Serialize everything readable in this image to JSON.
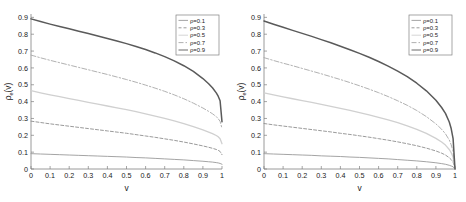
{
  "figure": {
    "panel_count": 2,
    "background": "#ffffff"
  },
  "chart_data": [
    {
      "type": "line",
      "panel": "left",
      "title": "",
      "xlabel": "v",
      "ylabel": "ρ_e(v)",
      "xlim": [
        0,
        1
      ],
      "ylim": [
        0,
        0.92
      ],
      "grid": false,
      "legend_position": "top-right",
      "xticks": [
        0,
        0.1,
        0.2,
        0.3,
        0.4,
        0.5,
        0.6,
        0.7,
        0.8,
        0.9,
        1
      ],
      "xticklabels": [
        "0",
        "0.1",
        "0.2",
        "0.3",
        "0.4",
        "0.5",
        "0.6",
        "0.7",
        "0.8",
        "0.9",
        "1"
      ],
      "yticks": [
        0,
        0.1,
        0.2,
        0.3,
        0.4,
        0.5,
        0.6,
        0.7,
        0.8,
        0.9
      ],
      "yticklabels": [
        "0",
        "0.1",
        "0.2",
        "0.3",
        "0.4",
        "0.5",
        "0.6",
        "0.7",
        "0.8",
        "0.9"
      ],
      "x": [
        0,
        0.05,
        0.1,
        0.15,
        0.2,
        0.25,
        0.3,
        0.35,
        0.4,
        0.45,
        0.5,
        0.55,
        0.6,
        0.65,
        0.7,
        0.75,
        0.8,
        0.85,
        0.9,
        0.93,
        0.95,
        0.97,
        0.98,
        0.99,
        1
      ],
      "series": [
        {
          "name": "ρ=0.1",
          "rho": 0.1,
          "style": "solid",
          "color": "#9a9a9a",
          "values": [
            0.091,
            0.089,
            0.087,
            0.085,
            0.083,
            0.081,
            0.079,
            0.077,
            0.075,
            0.073,
            0.071,
            0.068,
            0.066,
            0.063,
            0.06,
            0.057,
            0.054,
            0.05,
            0.046,
            0.043,
            0.041,
            0.038,
            0.036,
            0.033,
            0.028
          ]
        },
        {
          "name": "ρ=0.3",
          "rho": 0.3,
          "style": "dashed",
          "color": "#8f8f8f",
          "values": [
            0.284,
            0.276,
            0.268,
            0.261,
            0.254,
            0.247,
            0.24,
            0.233,
            0.226,
            0.219,
            0.212,
            0.204,
            0.196,
            0.188,
            0.179,
            0.17,
            0.16,
            0.149,
            0.137,
            0.129,
            0.123,
            0.116,
            0.111,
            0.104,
            0.085
          ]
        },
        {
          "name": "ρ=0.5",
          "rho": 0.5,
          "style": "solid-light",
          "color": "#d0d0d0",
          "values": [
            0.465,
            0.452,
            0.44,
            0.429,
            0.418,
            0.407,
            0.396,
            0.385,
            0.374,
            0.363,
            0.352,
            0.34,
            0.327,
            0.314,
            0.3,
            0.285,
            0.269,
            0.251,
            0.232,
            0.219,
            0.21,
            0.199,
            0.191,
            0.18,
            0.15
          ]
        },
        {
          "name": "ρ=0.7",
          "rho": 0.7,
          "style": "dash-dot",
          "color": "#a8a8a8",
          "values": [
            0.676,
            0.66,
            0.645,
            0.631,
            0.617,
            0.603,
            0.589,
            0.575,
            0.561,
            0.546,
            0.531,
            0.515,
            0.498,
            0.48,
            0.461,
            0.44,
            0.417,
            0.391,
            0.362,
            0.342,
            0.328,
            0.311,
            0.299,
            0.283,
            0.24
          ]
        },
        {
          "name": "ρ=0.9",
          "rho": 0.9,
          "style": "solid-bold",
          "color": "#5a5a5a",
          "values": [
            0.891,
            0.875,
            0.86,
            0.846,
            0.832,
            0.818,
            0.804,
            0.79,
            0.775,
            0.76,
            0.744,
            0.727,
            0.709,
            0.689,
            0.667,
            0.642,
            0.613,
            0.579,
            0.537,
            0.506,
            0.482,
            0.452,
            0.432,
            0.405,
            0.28
          ]
        }
      ]
    },
    {
      "type": "line",
      "panel": "right",
      "title": "",
      "xlabel": "v",
      "ylabel": "ρ_e(v)",
      "xlim": [
        0,
        1
      ],
      "ylim": [
        0,
        0.92
      ],
      "grid": false,
      "legend_position": "top-right",
      "xticks": [
        0,
        0.1,
        0.2,
        0.3,
        0.4,
        0.5,
        0.6,
        0.7,
        0.8,
        0.9,
        1
      ],
      "xticklabels": [
        "0",
        "0.1",
        "0.2",
        "0.3",
        "0.4",
        "0.5",
        "0.6",
        "0.7",
        "0.8",
        "0.9",
        "1"
      ],
      "yticks": [
        0,
        0.1,
        0.2,
        0.3,
        0.4,
        0.5,
        0.6,
        0.7,
        0.8,
        0.9
      ],
      "yticklabels": [
        "0",
        "0.1",
        "0.2",
        "0.3",
        "0.4",
        "0.5",
        "0.6",
        "0.7",
        "0.8",
        "0.9"
      ],
      "x": [
        0,
        0.05,
        0.1,
        0.15,
        0.2,
        0.25,
        0.3,
        0.35,
        0.4,
        0.45,
        0.5,
        0.55,
        0.6,
        0.65,
        0.7,
        0.75,
        0.8,
        0.85,
        0.9,
        0.93,
        0.95,
        0.97,
        0.98,
        0.99,
        1
      ],
      "series": [
        {
          "name": "ρ=0.1",
          "rho": 0.1,
          "style": "solid",
          "color": "#9a9a9a",
          "values": [
            0.091,
            0.089,
            0.087,
            0.085,
            0.083,
            0.081,
            0.078,
            0.076,
            0.074,
            0.071,
            0.069,
            0.066,
            0.063,
            0.06,
            0.056,
            0.052,
            0.048,
            0.043,
            0.037,
            0.032,
            0.028,
            0.022,
            0.018,
            0.013,
            0.0
          ]
        },
        {
          "name": "ρ=0.3",
          "rho": 0.3,
          "style": "dashed",
          "color": "#8f8f8f",
          "values": [
            0.27,
            0.262,
            0.255,
            0.248,
            0.241,
            0.234,
            0.227,
            0.22,
            0.212,
            0.205,
            0.197,
            0.189,
            0.18,
            0.171,
            0.161,
            0.15,
            0.138,
            0.124,
            0.107,
            0.094,
            0.083,
            0.067,
            0.056,
            0.041,
            0.0
          ]
        },
        {
          "name": "ρ=0.5",
          "rho": 0.5,
          "style": "solid-light",
          "color": "#d0d0d0",
          "values": [
            0.452,
            0.44,
            0.428,
            0.417,
            0.406,
            0.395,
            0.384,
            0.372,
            0.36,
            0.348,
            0.335,
            0.321,
            0.307,
            0.291,
            0.275,
            0.256,
            0.235,
            0.211,
            0.182,
            0.16,
            0.142,
            0.116,
            0.097,
            0.071,
            0.0
          ]
        },
        {
          "name": "ρ=0.7",
          "rho": 0.7,
          "style": "dash-dot",
          "color": "#a8a8a8",
          "values": [
            0.661,
            0.644,
            0.628,
            0.613,
            0.597,
            0.581,
            0.565,
            0.548,
            0.531,
            0.513,
            0.494,
            0.474,
            0.453,
            0.43,
            0.405,
            0.378,
            0.347,
            0.311,
            0.268,
            0.236,
            0.209,
            0.172,
            0.144,
            0.105,
            0.0
          ]
        },
        {
          "name": "ρ=0.9",
          "rho": 0.9,
          "style": "solid-bold",
          "color": "#5a5a5a",
          "values": [
            0.878,
            0.859,
            0.841,
            0.823,
            0.805,
            0.787,
            0.768,
            0.749,
            0.729,
            0.708,
            0.686,
            0.663,
            0.638,
            0.611,
            0.581,
            0.548,
            0.509,
            0.464,
            0.408,
            0.365,
            0.33,
            0.279,
            0.24,
            0.18,
            0.0
          ]
        }
      ]
    }
  ]
}
